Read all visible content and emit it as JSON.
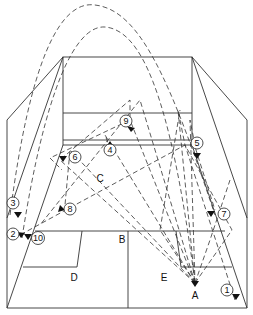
{
  "diagram": {
    "type": "court-shot-paths",
    "markers": [
      {
        "id": "1",
        "x": 227,
        "y": 290
      },
      {
        "id": "2",
        "x": 13,
        "y": 234
      },
      {
        "id": "3",
        "x": 13,
        "y": 203
      },
      {
        "id": "4",
        "x": 110,
        "y": 150
      },
      {
        "id": "5",
        "x": 197,
        "y": 143
      },
      {
        "id": "6",
        "x": 75,
        "y": 157
      },
      {
        "id": "7",
        "x": 224,
        "y": 214
      },
      {
        "id": "8",
        "x": 70,
        "y": 209
      },
      {
        "id": "9",
        "x": 126,
        "y": 121
      },
      {
        "id": "10",
        "x": 37,
        "y": 238
      }
    ],
    "labels": [
      {
        "text": "A",
        "x": 195,
        "y": 295
      },
      {
        "text": "B",
        "x": 122,
        "y": 239
      },
      {
        "text": "C",
        "x": 100,
        "y": 178
      },
      {
        "text": "D",
        "x": 74,
        "y": 277
      },
      {
        "text": "E",
        "x": 164,
        "y": 277
      }
    ]
  }
}
